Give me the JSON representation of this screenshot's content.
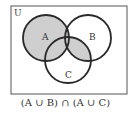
{
  "diagram": {
    "universe_label": "U",
    "sets": [
      {
        "label": "A",
        "cx": 46,
        "cy": 38,
        "r": 23
      },
      {
        "label": "B",
        "cx": 88,
        "cy": 38,
        "r": 23
      },
      {
        "label": "C",
        "cx": 68,
        "cy": 60,
        "r": 23
      }
    ],
    "caption": "(A ∪ B) ∩ (A ∪ C)",
    "shade_color": "#cfcfcf",
    "stroke_color": "#2a2a2a"
  }
}
